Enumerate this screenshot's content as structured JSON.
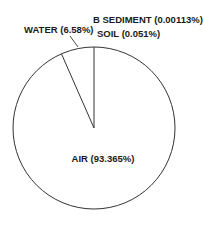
{
  "chart_data": {
    "type": "pie",
    "title": "",
    "categories": [
      "AIR",
      "WATER",
      "SOIL",
      "B SEDIMENT"
    ],
    "values": [
      93.365,
      6.58,
      0.051,
      0.00113
    ],
    "unit": "%",
    "labels": [
      "AIR (93.365%)",
      "WATER (6.58%)",
      "SOIL (0.051%)",
      "B SEDIMENT (0.00113%)"
    ],
    "start_angle": "top (12 o'clock)",
    "direction": "counter-clockwise for WATER slice from top",
    "fill": "#ffffff",
    "stroke": "#333333",
    "legend": "none (labels placed beside slices)"
  },
  "labels": {
    "air": "AIR (93.365%)",
    "water": "WATER (6.58%)",
    "soil": "SOIL (0.051%)",
    "sediment": "B SEDIMENT (0.00113%)"
  }
}
